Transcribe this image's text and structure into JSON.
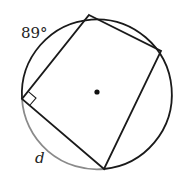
{
  "diagram": {
    "type": "inscribed quadrilateral in circle",
    "labels": {
      "arc_angle": "89°",
      "unknown_arc": "d"
    },
    "colors": {
      "stroke": "#1a1a1a",
      "highlight_arc": "#8a8a8a"
    }
  }
}
